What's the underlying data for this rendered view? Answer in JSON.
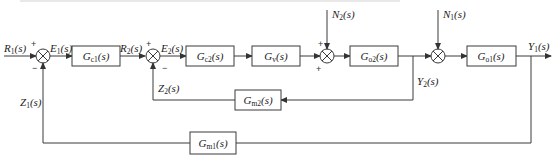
{
  "diagram": {
    "type": "control-block-diagram",
    "signals": {
      "R1": "R",
      "R1_sub": "1",
      "R1_tail": "(s)",
      "E1": "E",
      "E1_sub": "1",
      "E1_tail": "(s)",
      "R2": "R",
      "R2_sub": "2",
      "R2_tail": "(s)",
      "E2": "E",
      "E2_sub": "2",
      "E2_tail": "(s)",
      "N2": "N",
      "N2_sub": "2",
      "N2_tail": "(s)",
      "N1": "N",
      "N1_sub": "1",
      "N1_tail": "(s)",
      "Y1": "Y",
      "Y1_sub": "1",
      "Y1_tail": "(s)",
      "Y2": "Y",
      "Y2_sub": "2",
      "Y2_tail": "(s)",
      "Z1": "Z",
      "Z1_sub": "1",
      "Z1_tail": "(s)",
      "Z2": "Z",
      "Z2_sub": "2",
      "Z2_tail": "(s)"
    },
    "blocks": {
      "Gc1": {
        "main": "G",
        "sub": "c1",
        "tail": "(s)"
      },
      "Gc2": {
        "main": "G",
        "sub": "c2",
        "tail": "(s)"
      },
      "Gv": {
        "main": "G",
        "sub": "v",
        "tail": "(s)"
      },
      "Go2": {
        "main": "G",
        "sub": "o2",
        "tail": "(s)"
      },
      "Go1": {
        "main": "G",
        "sub": "o1",
        "tail": "(s)"
      },
      "Gm2": {
        "main": "G",
        "sub": "m2",
        "tail": "(s)"
      },
      "Gm1": {
        "main": "G",
        "sub": "m1",
        "tail": "(s)"
      }
    },
    "signs": {
      "sum1_top": "+",
      "sum1_bottom": "−",
      "sum2_top": "+",
      "sum2_bottom": "−",
      "sum3_top": "+",
      "sum3_bottom": "+"
    }
  }
}
